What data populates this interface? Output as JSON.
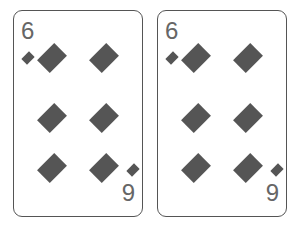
{
  "cards": [
    {
      "top_rank": "6",
      "bottom_rank": "9",
      "suit": "diamond-icon",
      "pip_color": "#555555"
    },
    {
      "top_rank": "6",
      "bottom_rank": "9",
      "suit": "diamond-icon",
      "pip_color": "#555555"
    }
  ]
}
